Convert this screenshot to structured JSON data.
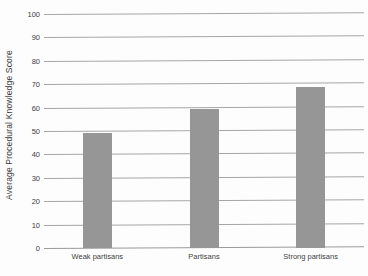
{
  "chart_data": {
    "type": "bar",
    "title": "",
    "subtitle": "",
    "xlabel": "",
    "ylabel": "Average Procedural Knowledge Score",
    "categories": [
      "Weak partisans",
      "Partisans",
      "Strong partisans"
    ],
    "values": [
      49,
      59.5,
      69
    ],
    "ylim": [
      0,
      100
    ],
    "yticks": [
      0,
      10,
      20,
      30,
      40,
      50,
      60,
      70,
      80,
      90,
      100
    ],
    "ytick_labels": [
      "0",
      "10",
      "20",
      "30",
      "40",
      "50",
      "60",
      "70",
      "80",
      "90",
      "100"
    ],
    "grid": true,
    "grid_axis": "y",
    "legend": false,
    "legend_position": "none",
    "bar_color": "#969696",
    "gridline_color": "#a6a6a6",
    "background_color": "#fdfdfd",
    "text_color": "#3d3d3d",
    "series": [
      {
        "name": "Average Procedural Knowledge Score",
        "values": [
          49,
          59.5,
          69
        ]
      }
    ]
  }
}
